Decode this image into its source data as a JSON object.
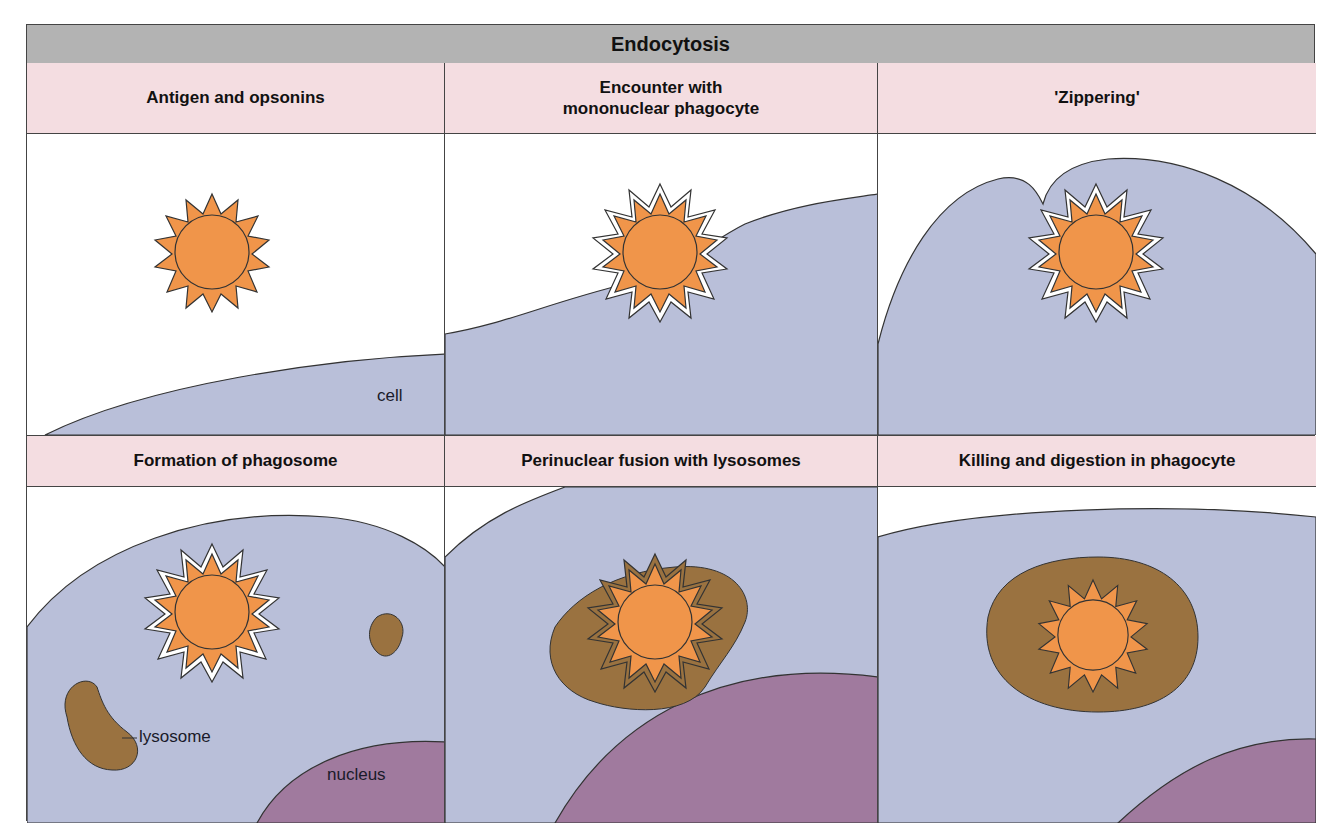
{
  "title": "Endocytosis",
  "colors": {
    "title_bar": "#b3b3b3",
    "panel_header": "#f4dde1",
    "cell": "#b9bfd9",
    "antigen": "#f0954a",
    "lysosome": "#9a7240",
    "nucleus": "#a07a9e"
  },
  "panels": [
    {
      "title": "Antigen and opsonins",
      "labels": {
        "cell": "cell"
      }
    },
    {
      "title": "Encounter with\nmononuclear phagocyte"
    },
    {
      "title": "'Zippering'"
    },
    {
      "title": "Formation of phagosome",
      "labels": {
        "lysosome": "lysosome",
        "nucleus": "nucleus"
      }
    },
    {
      "title": "Perinuclear fusion with lysosomes"
    },
    {
      "title": "Killing and digestion in phagocyte"
    }
  ]
}
